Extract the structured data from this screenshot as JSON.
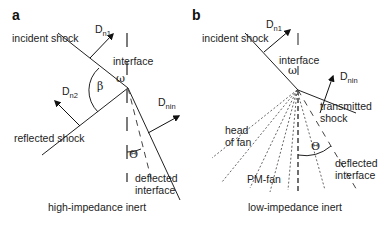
{
  "panels": [
    {
      "id": "a",
      "label": "a",
      "caption": "high-impedance inert",
      "labels": {
        "incident_shock": "incident shock",
        "interface": "interface",
        "reflected_shock": "reflected shock",
        "deflected_interface_line1": "deflected",
        "deflected_interface_line2": "interface",
        "omega": "ω",
        "beta": "β",
        "theta": "Θ",
        "dn1_main": "D",
        "dn1_sub": "n1",
        "dn2_main": "D",
        "dn2_sub": "n2",
        "dnin_main": "D",
        "dnin_sub": "nin"
      }
    },
    {
      "id": "b",
      "label": "b",
      "caption": "low-impedance inert",
      "labels": {
        "incident_shock": "incident shock",
        "interface": "interface",
        "transmitted_shock_line1": "transmitted",
        "transmitted_shock_line2": "shock",
        "head_of_fan_line1": "head",
        "head_of_fan_line2": "of fan",
        "pm_fan": "PM-fan",
        "deflected_interface_line1": "deflected",
        "deflected_interface_line2": "interface",
        "omega": "ω",
        "theta": "Θ",
        "dn1_main": "D",
        "dn1_sub": "n1",
        "dnin_main": "D",
        "dnin_sub": "nin"
      }
    }
  ],
  "colors": {
    "line": "#222222",
    "dashed": "#444444",
    "text": "#222222",
    "background": "#ffffff"
  }
}
